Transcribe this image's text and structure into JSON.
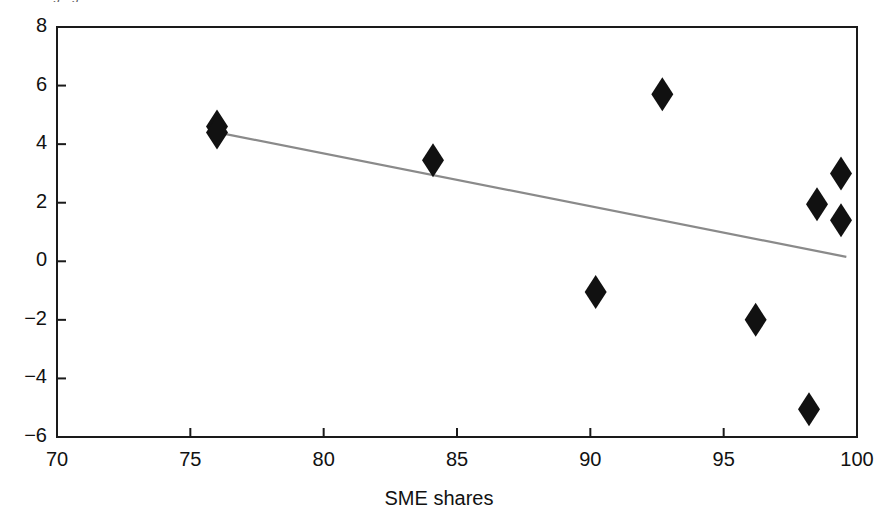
{
  "figure": {
    "clipped_top_text": "Average growth",
    "background_color": "#ffffff",
    "axis_color": "#1a1a1a",
    "marker_color": "#111111",
    "trendline_color": "#8a8a8a"
  },
  "chart_data": {
    "type": "scatter",
    "title": "",
    "xlabel": "SME shares",
    "ylabel": "",
    "xlim": [
      70,
      100
    ],
    "ylim": [
      -6,
      8
    ],
    "xticks": [
      70,
      75,
      80,
      85,
      90,
      95,
      100
    ],
    "yticks": [
      8,
      6,
      4,
      2,
      0,
      -2,
      -4,
      -6
    ],
    "xtick_labels": [
      "70",
      "75",
      "80",
      "85",
      "90",
      "95",
      "100"
    ],
    "ytick_labels": [
      "8",
      "6",
      "4",
      "2",
      "0",
      "−2",
      "−4",
      "−6"
    ],
    "grid": false,
    "legend": null,
    "marker": "diamond",
    "points": [
      {
        "x": 76.0,
        "y": 4.6
      },
      {
        "x": 76.0,
        "y": 4.4
      },
      {
        "x": 84.1,
        "y": 3.45
      },
      {
        "x": 92.7,
        "y": 5.7
      },
      {
        "x": 90.2,
        "y": -1.05
      },
      {
        "x": 96.2,
        "y": -2.0
      },
      {
        "x": 98.5,
        "y": 1.95
      },
      {
        "x": 99.4,
        "y": 3.0
      },
      {
        "x": 99.4,
        "y": 1.4
      },
      {
        "x": 98.2,
        "y": -5.05
      }
    ],
    "trendline": {
      "type": "linear-fit",
      "x_start": 76.0,
      "y_start": 4.4,
      "x_end": 99.6,
      "y_end": 0.15,
      "slope": -0.18,
      "intercept": 18.1
    }
  }
}
